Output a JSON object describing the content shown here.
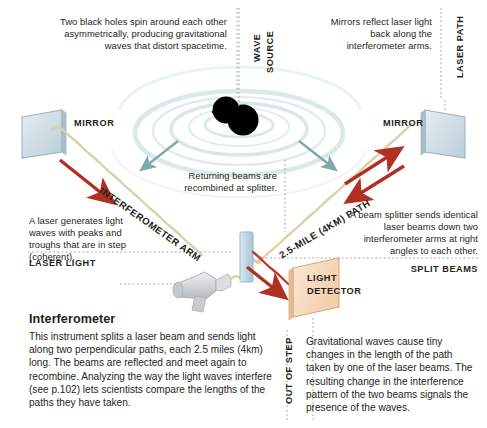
{
  "diagram": {
    "title": "Interferometer",
    "body": "This instrument splits a laser beam and sends light along two perpendicular paths, each 2.5 miles (4km) long. The beams are reflected and meet again to recombine. Analyzing the way the light waves interfere (see p.102) lets scientists compare the lengths of the paths they have taken."
  },
  "callouts": {
    "black_holes": "Two black holes spin around each other asymmetrically, producing  gravitational waves that distort spacetime.",
    "mirrors_reflect": "Mirrors reflect laser light back along the interferometer arms.",
    "returning_beams": "Returning beams are recombined at splitter.",
    "laser_generates": "A laser generates light waves with peaks and troughs that are in step (coherent).",
    "beam_splitter": "A beam splitter sends identical laser beams down two interferometer arms at right angles to each other.",
    "gravitational_waves": "Gravitational waves cause tiny changes in the length of the path taken by one of the laser beams. The resulting change in the interference pattern of the two beams signals the presence of the waves."
  },
  "labels": {
    "wave": "WAVE",
    "source": "SOURCE",
    "laser_path": "LASER PATH",
    "mirror_left": "MIRROR",
    "mirror_right": "MIRROR",
    "interferometer_arm": "INTERFEROMETER ARM",
    "mile_path": "2.5-MILE (4KM) PATH",
    "laser_light": "LASER LIGHT",
    "split_beams": "SPLIT BEAMS",
    "light_detector_line1": "LIGHT",
    "light_detector_line2": "DETECTOR",
    "out_of_step": "OUT OF STEP"
  },
  "colors": {
    "ink": "#231f20",
    "wave_teal": "#bcd8d6",
    "arrow_teal": "#7fa8ab",
    "beam_tan": "#ddcfa8",
    "arrow_red": "#b03024",
    "beam_red": "#c0392b",
    "mirror_fill": "#cfdce4",
    "mirror_edge": "#9fb3c0",
    "splitter_fill": "#c3d7e4",
    "detector_fill": "#f6d9c0",
    "detector_edge": "#d9a97e",
    "laser_body": "#d6d8da",
    "black_hole": "#000000",
    "dotted": "#9a9a9a"
  }
}
